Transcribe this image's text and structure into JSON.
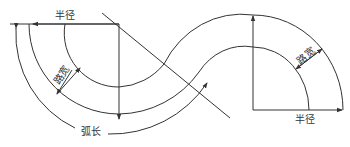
{
  "diagram": {
    "type": "curved road geometry (S-curve)",
    "labels": {
      "radius_top": "半径",
      "radius_bottom": "半径",
      "road_width_left": "路宽",
      "road_width_right": "路宽",
      "arc_length": "弧长"
    },
    "colors": {
      "line": "#333333",
      "background": "#ffffff"
    }
  }
}
